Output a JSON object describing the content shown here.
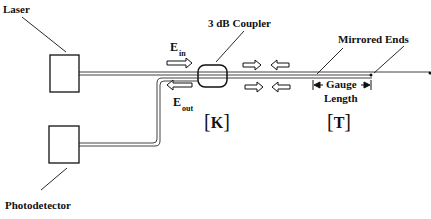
{
  "labels": {
    "laser": "Laser",
    "photodetector": "Photodetector",
    "coupler": "3 dB Coupler",
    "mirrored_ends": "Mirrored Ends",
    "gauge": "Gauge",
    "length": "Length",
    "e_in_main": "E",
    "e_in_sub": "in",
    "e_out_main": "E",
    "e_out_sub": "out",
    "k_open": "[",
    "k_letter": "K",
    "k_close": "]",
    "t_open": "[",
    "t_letter": "T",
    "t_close": "]"
  },
  "colors": {
    "line": "#111111",
    "background": "#ffffff"
  }
}
